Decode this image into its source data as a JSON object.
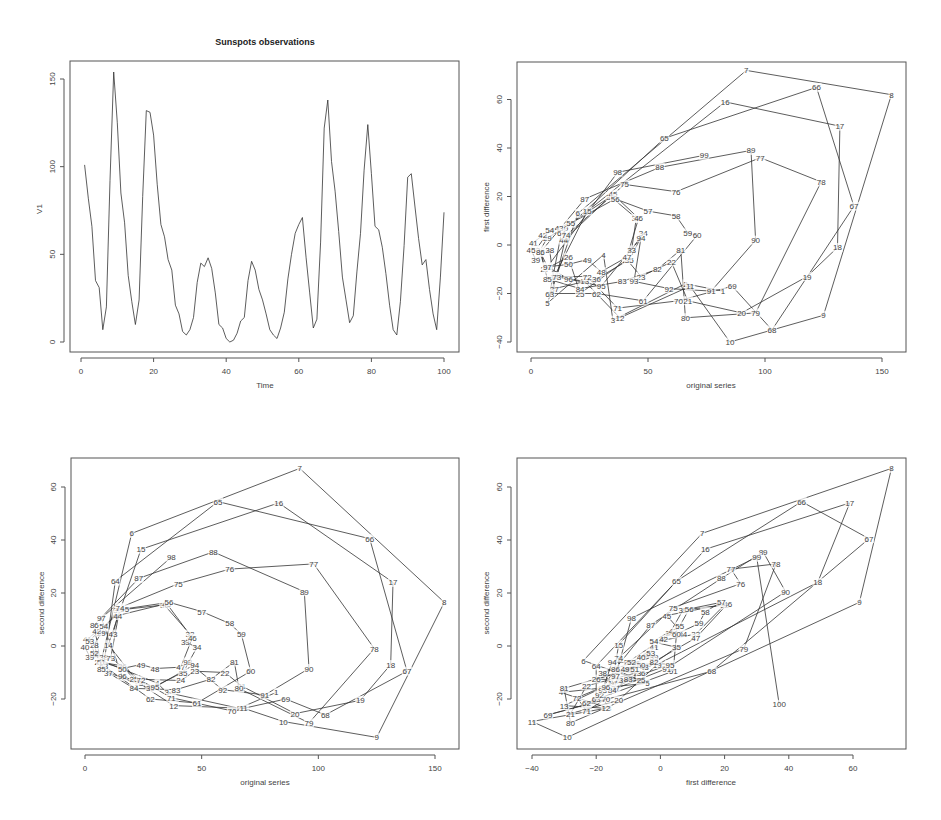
{
  "chart_data": [
    {
      "type": "line",
      "title": "Sunspots observations",
      "xlabel": "Time",
      "ylabel": "V1",
      "xlim": [
        0,
        100
      ],
      "ylim": [
        0,
        155
      ],
      "xticks": [
        0,
        20,
        40,
        60,
        80,
        100
      ],
      "yticks": [
        0,
        50,
        100,
        150
      ],
      "grid": false,
      "x": [
        1,
        2,
        3,
        4,
        5,
        6,
        7,
        8,
        9,
        10,
        11,
        12,
        13,
        14,
        15,
        16,
        17,
        18,
        19,
        20,
        21,
        22,
        23,
        24,
        25,
        26,
        27,
        28,
        29,
        30,
        31,
        32,
        33,
        34,
        35,
        36,
        37,
        38,
        39,
        40,
        41,
        42,
        43,
        44,
        45,
        46,
        47,
        48,
        49,
        50,
        51,
        52,
        53,
        54,
        55,
        56,
        57,
        58,
        59,
        60,
        61,
        62,
        63,
        64,
        65,
        66,
        67,
        68,
        69,
        70,
        71,
        72,
        73,
        74,
        75,
        76,
        77,
        78,
        79,
        80,
        81,
        82,
        83,
        84,
        85,
        86,
        87,
        88,
        89,
        90,
        91,
        92,
        93,
        94,
        95,
        96,
        97,
        98,
        99,
        100
      ],
      "values": [
        101,
        82,
        66,
        35,
        31,
        7,
        20,
        92,
        154,
        125,
        85,
        68,
        38,
        23,
        10,
        24,
        83,
        132,
        131,
        118,
        90,
        67,
        60,
        47,
        41,
        21,
        16,
        6,
        4,
        7,
        14,
        34,
        45,
        43,
        48,
        42,
        28,
        10,
        8,
        2,
        0,
        1,
        5,
        12,
        14,
        35,
        46,
        41,
        30,
        24,
        16,
        7,
        4,
        2,
        8,
        17,
        36,
        50,
        62,
        67,
        71,
        48,
        28,
        8,
        13,
        57,
        122,
        138,
        103,
        86,
        63,
        37,
        24,
        11,
        15,
        40,
        62,
        98,
        124,
        96,
        66,
        64,
        54,
        39,
        21,
        7,
        4,
        23,
        55,
        94,
        96,
        77,
        59,
        44,
        47,
        30,
        16,
        7,
        37,
        74
      ]
    },
    {
      "type": "scatter",
      "title": "",
      "xlabel": "original series",
      "ylabel": "first difference",
      "xlim": [
        -5,
        160
      ],
      "ylim": [
        -45,
        75
      ],
      "xticks": [
        0,
        50,
        100,
        150
      ],
      "yticks": [
        -40,
        -20,
        0,
        20,
        40,
        60
      ],
      "connected": true,
      "point_labels": "index 1-99",
      "definition": "label i at (V[i+1], V[i+1]-V[i])"
    },
    {
      "type": "scatter",
      "title": "",
      "xlabel": "original series",
      "ylabel": "second difference",
      "xlim": [
        -5,
        160
      ],
      "ylim": [
        -40,
        70
      ],
      "xticks": [
        0,
        50,
        100,
        150
      ],
      "yticks": [
        -20,
        0,
        20,
        40,
        60
      ],
      "connected": true,
      "point_labels": "index 1-98",
      "definition": "label i at (V[i+1], (V[i+2]-V[i])/2)"
    },
    {
      "type": "scatter",
      "title": "",
      "xlabel": "first difference",
      "ylabel": "second difference",
      "xlim": [
        -44,
        76
      ],
      "ylim": [
        -40,
        70
      ],
      "xticks": [
        -40,
        -20,
        0,
        20,
        40,
        60
      ],
      "yticks": [
        -20,
        0,
        20,
        40,
        60
      ],
      "connected": true,
      "point_labels": "index 2-100",
      "definition": "label i at (V[i]-V[i-1], (V[i+1]-V[i-1])/2)",
      "extra_points": [
        {
          "label": "100",
          "x": 37,
          "y": -22
        }
      ]
    }
  ],
  "panels": {
    "p1": {
      "title": "Sunspots observations",
      "xlabel": "Time",
      "ylabel": "V1"
    },
    "p2": {
      "xlabel": "original series",
      "ylabel": "first difference"
    },
    "p3": {
      "xlabel": "original series",
      "ylabel": "second difference"
    },
    "p4": {
      "xlabel": "first difference",
      "ylabel": "second difference"
    }
  }
}
